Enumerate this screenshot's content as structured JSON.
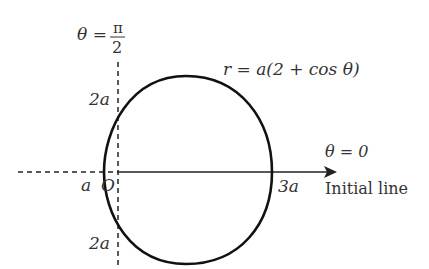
{
  "diagram": {
    "equation": "r = a(2 + cos θ)",
    "vertical_axis_label": {
      "lhs": "θ =",
      "num": "π",
      "den": "2"
    },
    "horizontal_axis_label": "θ = 0",
    "initial_line_label": "Initial line",
    "pole_label": "O",
    "labels": {
      "top_intercept": "2a",
      "bottom_intercept": "2a",
      "left_intercept": "a",
      "right_intercept": "3a"
    },
    "colors": {
      "curve": "#111111",
      "axes": "#222222",
      "text": "#333333"
    }
  }
}
